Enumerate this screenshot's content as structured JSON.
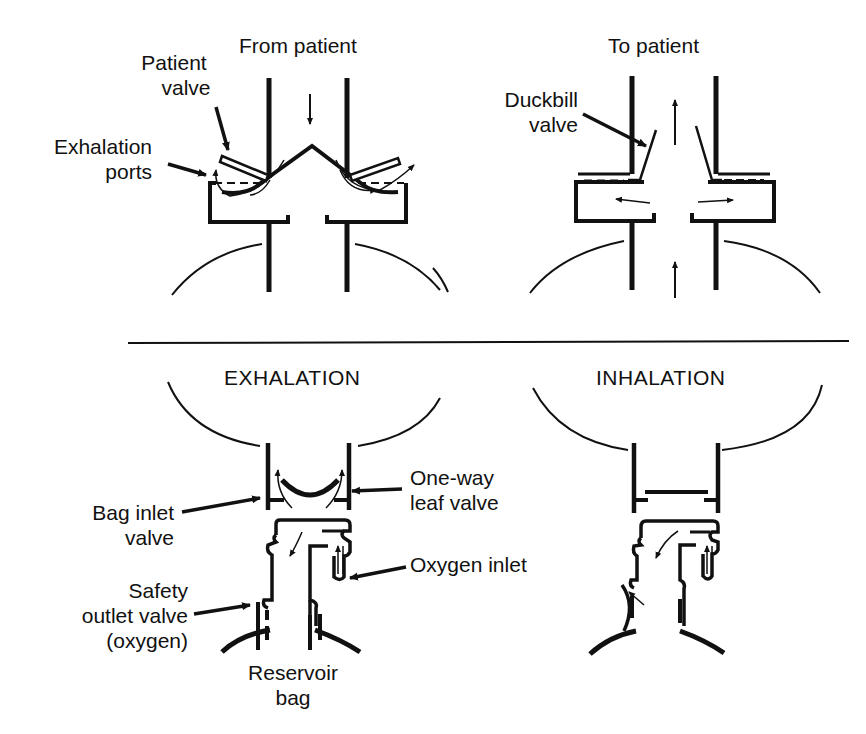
{
  "top_left_panel": {
    "title": "From patient",
    "labels": {
      "patient_valve_line1": "Patient",
      "patient_valve_line2": "valve",
      "exhalation_ports_line1": "Exhalation",
      "exhalation_ports_line2": "ports"
    }
  },
  "top_right_panel": {
    "title": "To patient",
    "labels": {
      "duckbill_line1": "Duckbill",
      "duckbill_line2": "valve"
    }
  },
  "bottom_left_panel": {
    "title": "EXHALATION",
    "labels": {
      "bag_inlet_line1": "Bag inlet",
      "bag_inlet_line2": "valve",
      "one_way_line1": "One-way",
      "one_way_line2": "leaf valve",
      "oxygen_inlet": "Oxygen inlet",
      "safety_line1": "Safety",
      "safety_line2": "outlet valve",
      "safety_line3": "(oxygen)",
      "reservoir_line1": "Reservoir",
      "reservoir_line2": "bag"
    }
  },
  "bottom_right_panel": {
    "title": "INHALATION"
  },
  "colors": {
    "ink": "#111111",
    "background": "#ffffff"
  }
}
